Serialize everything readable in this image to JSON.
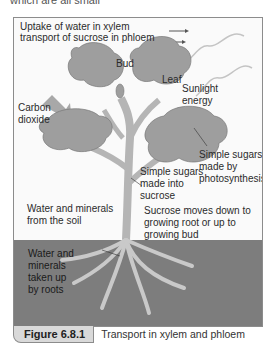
{
  "context_text": "which are all small",
  "legend": {
    "xylem": "Uptake of water in xylem",
    "phloem": "transport of sucrose in phloem"
  },
  "labels": {
    "bud": "Bud",
    "leaf": "Leaf",
    "sunlight": [
      "Sunlight",
      "energy"
    ],
    "carbon_dioxide": [
      "Carbon",
      "dioxide"
    ],
    "sugars_photosynthesis": [
      "Simple sugars",
      "made by",
      "photosynthesis"
    ],
    "sugars_sucrose": [
      "Simple sugars",
      "made into",
      "sucrose"
    ],
    "water_soil": [
      "Water and minerals",
      "from the soil"
    ],
    "sucrose_moves": [
      "Sucrose moves down to",
      "growing root or up to",
      "growing bud"
    ],
    "roots": [
      "Water and",
      "minerals",
      "taken up",
      "by roots"
    ]
  },
  "caption": {
    "figure_number": "Figure 6.8.1",
    "title": "Transport in xylem and phloem"
  },
  "colors": {
    "leaf": "#9e9e9e",
    "stem": "#b5b5b5",
    "soil": "#7d7d7d",
    "arrow": "#a8a8a8"
  }
}
